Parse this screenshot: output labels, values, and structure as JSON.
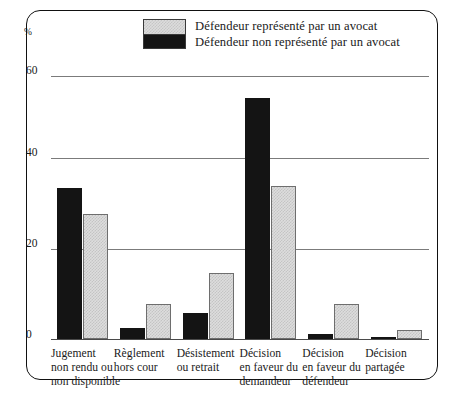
{
  "chart_data": {
    "type": "bar",
    "title": "",
    "xlabel": "",
    "ylabel": "%",
    "ylim": [
      0,
      60
    ],
    "yticks": [
      0,
      20,
      40,
      60
    ],
    "grid": true,
    "legend_position": "top",
    "categories": [
      "Jugement non rendu ou non disponible",
      "Règlement hors cour",
      "Désistement ou retrait",
      "Décision en faveur du demandeur",
      "Décision en faveur du défendeur",
      "Décision partagée"
    ],
    "category_lines": [
      [
        "Jugement",
        "non rendu ou",
        "non disponible"
      ],
      [
        "Règlement",
        "hors cour"
      ],
      [
        "Désistement",
        "ou retrait"
      ],
      [
        "Décision",
        "en faveur du",
        "demandeur"
      ],
      [
        "Décision",
        "en faveur du",
        "défendeur"
      ],
      [
        "Décision",
        "partagée"
      ]
    ],
    "series": [
      {
        "name": "Défendeur non représenté par un avocat",
        "color": "#141414",
        "values": [
          34.5,
          2.5,
          6.0,
          55.0,
          1.2,
          0.4
        ]
      },
      {
        "name": "Défendeur représenté par un avocat",
        "color": "#dddddd",
        "values": [
          28.5,
          8.0,
          15.0,
          35.0,
          8.0,
          2.0
        ]
      }
    ]
  },
  "legend": {
    "items": [
      {
        "label": "Défendeur représenté par un avocat",
        "swatch": "light-hatched"
      },
      {
        "label": "Défendeur non représenté par un avocat",
        "swatch": "black-solid"
      }
    ]
  },
  "axis": {
    "unit_label": "%",
    "tick_labels": [
      "60",
      "40",
      "20",
      "0"
    ]
  }
}
